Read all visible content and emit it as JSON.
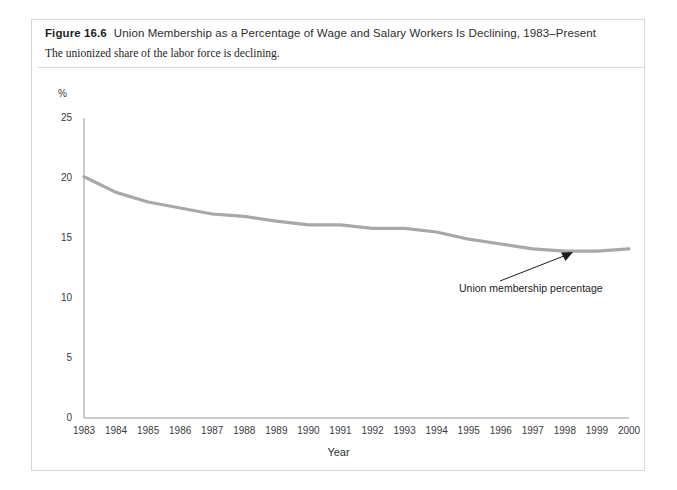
{
  "figure": {
    "label": "Figure 16.6",
    "title": "Union Membership as a Percentage of Wage and Salary Workers Is Declining, 1983–Present",
    "subtitle": "The unionized share of the labor force is declining.",
    "accent_color": "#b9b9b9",
    "border_color": "#d7d7d7"
  },
  "chart_data": {
    "type": "line",
    "title": "Union Membership as a Percentage of Wage and Salary Workers Is Declining, 1983–Present",
    "subtitle": "The unionized share of the labor force is declining.",
    "xlabel": "Year",
    "ylabel": "%",
    "x": [
      1983,
      1984,
      1985,
      1986,
      1987,
      1988,
      1989,
      1990,
      1991,
      1992,
      1993,
      1994,
      1995,
      1996,
      1997,
      1998,
      1999,
      2000
    ],
    "categories": [
      "1983",
      "1984",
      "1985",
      "1986",
      "1987",
      "1988",
      "1989",
      "1990",
      "1991",
      "1992",
      "1993",
      "1994",
      "1995",
      "1996",
      "1997",
      "1998",
      "1999",
      "2000"
    ],
    "series": [
      {
        "name": "Union membership percentage",
        "color": "#a8a8a8",
        "values": [
          20.1,
          18.8,
          18.0,
          17.5,
          17.0,
          16.8,
          16.4,
          16.1,
          16.1,
          15.8,
          15.8,
          15.5,
          14.9,
          14.5,
          14.1,
          13.9,
          13.9,
          14.1
        ]
      }
    ],
    "annotations": [
      {
        "text": "Union membership percentage",
        "points_to_year": 1998,
        "points_to_value": 14.0
      }
    ],
    "yticks": [
      0,
      5,
      10,
      15,
      20,
      25
    ],
    "ylim": [
      0,
      25
    ],
    "xlim": [
      1983,
      2000
    ],
    "grid": false,
    "legend": "none",
    "axis_color": "#9a9a9a"
  }
}
